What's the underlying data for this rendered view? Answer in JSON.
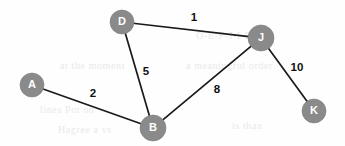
{
  "figure": {
    "kind": "weighted-undirected-graph",
    "width": 345,
    "height": 146,
    "background_color": "#fefefe",
    "node_fill_color": "#8a8a8a",
    "node_label_color": "#ffffff",
    "edge_color": "#1a1a1a",
    "weight_label_color": "#111111"
  },
  "chart_data": {
    "type": "diagram",
    "title": "",
    "nodes": [
      {
        "id": "A",
        "label": "A",
        "x": 32,
        "y": 85,
        "r": 12
      },
      {
        "id": "B",
        "label": "B",
        "x": 153,
        "y": 128,
        "r": 13
      },
      {
        "id": "D",
        "label": "D",
        "x": 122,
        "y": 22,
        "r": 12
      },
      {
        "id": "J",
        "label": "J",
        "x": 261,
        "y": 38,
        "r": 13
      },
      {
        "id": "K",
        "label": "K",
        "x": 314,
        "y": 111,
        "r": 12
      }
    ],
    "edges": [
      {
        "source": "D",
        "target": "J",
        "weight": "1",
        "label_x": 194,
        "label_y": 18
      },
      {
        "source": "D",
        "target": "B",
        "weight": "5",
        "label_x": 146,
        "label_y": 72
      },
      {
        "source": "A",
        "target": "B",
        "weight": "2",
        "label_x": 93,
        "label_y": 94
      },
      {
        "source": "B",
        "target": "J",
        "weight": "8",
        "label_x": 217,
        "label_y": 90
      },
      {
        "source": "J",
        "target": "K",
        "weight": "10",
        "label_x": 297,
        "label_y": 68
      }
    ]
  },
  "background_watermark": [
    {
      "text": "O-E-F-J-I-B-A",
      "x": 196,
      "y": 30
    },
    {
      "text": "a meaningful order",
      "x": 186,
      "y": 60
    },
    {
      "text": "at the moment",
      "x": 60,
      "y": 60
    },
    {
      "text": "lines Pot on",
      "x": 40,
      "y": 104
    },
    {
      "text": "Hagree a vs",
      "x": 58,
      "y": 124
    },
    {
      "text": "is than",
      "x": 232,
      "y": 120
    }
  ]
}
